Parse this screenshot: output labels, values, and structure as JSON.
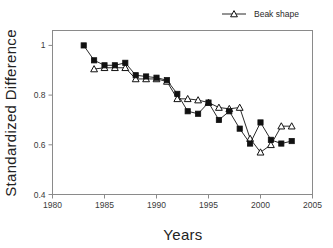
{
  "chart_data": {
    "type": "line",
    "title": "",
    "xlabel": "Years",
    "ylabel": "Standardized  Difference",
    "xlim": [
      1980,
      2005
    ],
    "ylim": [
      0.4,
      1.06
    ],
    "xticks": [
      1980,
      1985,
      1990,
      1995,
      2000,
      2005
    ],
    "xtick_labels": [
      "1980",
      "1985",
      "1990",
      "1995",
      "2000",
      "2005"
    ],
    "yticks": [
      0.4,
      0.6,
      0.8,
      1.0
    ],
    "ytick_labels": [
      "0.4",
      "0.6",
      "0.8",
      "1"
    ],
    "grid": false,
    "legend_position": "top-right",
    "x": [
      1983,
      1984,
      1985,
      1986,
      1987,
      1988,
      1989,
      1990,
      1991,
      1992,
      1993,
      1994,
      1995,
      1996,
      1997,
      1998,
      1999,
      2000,
      2001,
      2002,
      2003
    ],
    "series": [
      {
        "name": "Beak shape",
        "marker": "open-triangle",
        "color": "#111111",
        "x": [
          1984,
          1985,
          1986,
          1987,
          1988,
          1989,
          1990,
          1991,
          1992,
          1993,
          1994,
          1995,
          1996,
          1997,
          1998,
          1999,
          2000,
          2001,
          2002,
          2003
        ],
        "values": [
          0.905,
          0.91,
          0.91,
          0.91,
          0.865,
          0.865,
          0.865,
          0.855,
          0.785,
          0.785,
          0.78,
          0.77,
          0.75,
          0.745,
          0.75,
          0.625,
          0.57,
          0.6,
          0.675,
          0.675
        ]
      },
      {
        "name": "",
        "marker": "filled-square",
        "color": "#111111",
        "x": [
          1983,
          1984,
          1985,
          1986,
          1987,
          1988,
          1989,
          1990,
          1991,
          1992,
          1993,
          1994,
          1995,
          1996,
          1997,
          1998,
          1999,
          2000,
          2001,
          2002,
          2003
        ],
        "values": [
          1.0,
          0.94,
          0.92,
          0.92,
          0.93,
          0.88,
          0.875,
          0.87,
          0.86,
          0.805,
          0.735,
          0.725,
          0.77,
          0.7,
          0.735,
          0.665,
          0.605,
          0.69,
          0.62,
          0.605,
          0.615
        ]
      }
    ],
    "legend": [
      {
        "label": "Beak shape",
        "marker": "open-triangle"
      }
    ]
  }
}
